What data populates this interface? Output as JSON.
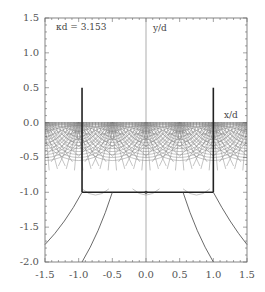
{
  "chart_data": {
    "type": "line",
    "title": "",
    "annotation": "κd = 3.153",
    "xlabel": "x/d",
    "ylabel": "y/d",
    "xlim": [
      -1.5,
      1.5
    ],
    "ylim": [
      -2.0,
      1.5
    ],
    "x_ticks": [
      "-1.5",
      "-1.0",
      "-0.5",
      "0.0",
      "0.5",
      "1.0",
      "1.5"
    ],
    "y_ticks": [
      "1.5",
      "1.0",
      "0.5",
      "0.0",
      "-0.5",
      "-1.0",
      "-1.5",
      "-2.0"
    ],
    "grid": false,
    "legend": null,
    "series": [
      {
        "name": "left-plate",
        "x": [
          -0.95,
          -0.95
        ],
        "y": [
          0.5,
          -1.0
        ]
      },
      {
        "name": "right-plate",
        "x": [
          1.0,
          1.0
        ],
        "y": [
          0.5,
          -1.0
        ]
      },
      {
        "name": "bottom-plate",
        "x": [
          -0.95,
          1.0
        ],
        "y": [
          -1.0,
          -1.0
        ]
      },
      {
        "name": "lower-curve-left-outer",
        "x": [
          -1.5,
          -1.2,
          -0.95
        ],
        "y": [
          -1.75,
          -1.45,
          -1.0
        ]
      },
      {
        "name": "lower-curve-left-inner",
        "x": [
          -0.95,
          -0.7,
          -0.5
        ],
        "y": [
          -2.0,
          -1.6,
          -1.0
        ]
      },
      {
        "name": "lower-curve-right-inner",
        "x": [
          0.55,
          0.75,
          1.0
        ],
        "y": [
          -1.0,
          -1.6,
          -2.0
        ]
      },
      {
        "name": "lower-curve-right-outer",
        "x": [
          1.0,
          1.25,
          1.5
        ],
        "y": [
          -1.0,
          -1.45,
          -1.75
        ]
      }
    ],
    "field_grid": {
      "region_y": [
        0.0,
        -1.0
      ],
      "description": "dense semicircular field-line grid below y=0"
    }
  }
}
